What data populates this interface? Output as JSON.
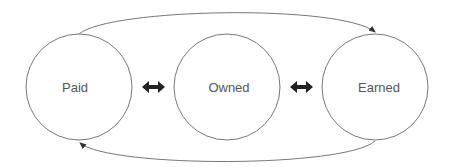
{
  "diagram": {
    "nodes": [
      {
        "id": "paid",
        "label": "Paid"
      },
      {
        "id": "owned",
        "label": "Owned"
      },
      {
        "id": "earned",
        "label": "Earned"
      }
    ],
    "edges": [
      {
        "from": "paid",
        "to": "owned",
        "type": "bidirectional"
      },
      {
        "from": "owned",
        "to": "earned",
        "type": "bidirectional"
      },
      {
        "from": "paid",
        "to": "earned",
        "type": "directed-arc-top"
      },
      {
        "from": "earned",
        "to": "paid",
        "type": "directed-arc-bottom"
      }
    ],
    "colors": {
      "stroke": "#777777",
      "arrow_fill": "#222222",
      "text": "#555555"
    }
  }
}
